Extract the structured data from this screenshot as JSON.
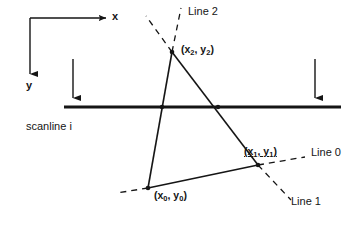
{
  "figure": {
    "background_color": "#ffffff",
    "stroke_color": "#151515"
  },
  "axes": {
    "x_label": "x",
    "y_label": "y",
    "origin": {
      "x": 30,
      "y": 18
    },
    "x_arrow_end": {
      "x": 108,
      "y": 18
    },
    "y_arrow_end": {
      "x": 30,
      "y": 84
    }
  },
  "scanline": {
    "label": "scanline i",
    "y": 107,
    "x_start": 64,
    "x_end": 341,
    "thickness": 3
  },
  "indicator_arrows": [
    {
      "name": "left-scan-direction-arrow",
      "x": 73,
      "y_start": 59,
      "y_end": 104
    },
    {
      "name": "right-scan-direction-arrow",
      "x": 315,
      "y_start": 59,
      "y_end": 104
    }
  ],
  "vertices": [
    {
      "id": "p2",
      "label": "(x",
      "sub": "2",
      "label_mid": ", y",
      "sub2": "2",
      "label_end": ")",
      "x": 172,
      "y": 52
    },
    {
      "id": "p1",
      "label": "(x",
      "sub": "1",
      "label_mid": ", y",
      "sub2": "1",
      "label_end": ")",
      "x": 258,
      "y": 165
    },
    {
      "id": "p0",
      "label": "(x",
      "sub": "0",
      "label_mid": ", y",
      "sub2": "0",
      "label_end": ")",
      "x": 148,
      "y": 188
    }
  ],
  "vertex_labels": {
    "p2": "(x2, y2)",
    "p1": "(x1, y1)",
    "p0": "(x0, y0)"
  },
  "edges": [
    {
      "name": "edge-p2-p0",
      "from": "p2",
      "to": "p0",
      "style": "solid"
    },
    {
      "name": "edge-p2-p1",
      "from": "p2",
      "to": "p1",
      "style": "solid"
    },
    {
      "name": "edge-p0-p1",
      "from": "p0",
      "to": "p1",
      "style": "solid"
    }
  ],
  "lines": [
    {
      "id": "line0",
      "label": "Line 0",
      "style": "dashed",
      "description": "extension of edge from (x0,y0) through (x1,y1) to the right"
    },
    {
      "id": "line1",
      "label": "Line 1",
      "style": "dashed",
      "description": "extension of edge from (x2,y2) through (x1,y1) downward right"
    },
    {
      "id": "line2",
      "label": "Line 2",
      "style": "dashed",
      "description": "extensions of the two edges meeting at the apex (x2,y2)"
    }
  ],
  "intersections": [
    {
      "name": "scanline-intersection-left",
      "x": 162,
      "y": 107
    },
    {
      "name": "scanline-intersection-right",
      "x": 218,
      "y": 107
    }
  ]
}
